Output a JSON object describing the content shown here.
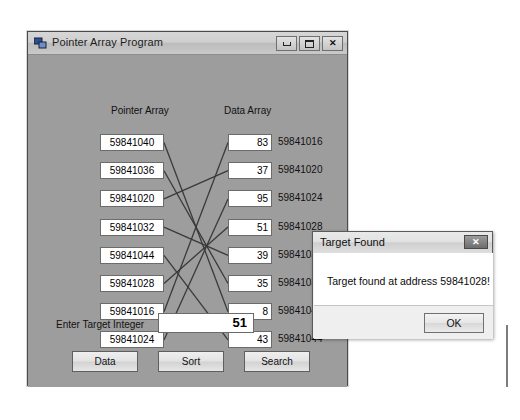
{
  "app_window": {
    "title": "Pointer Array Program",
    "icon": "form-app-icon",
    "controls": {
      "minimize": "minimize-icon",
      "maximize": "maximize-icon",
      "close": "close-icon"
    },
    "headers": {
      "pointer": "Pointer Array",
      "data": "Data Array"
    },
    "pointer_array": [
      "59841040",
      "59841036",
      "59841020",
      "59841032",
      "59841044",
      "59841028",
      "59841016",
      "59841024"
    ],
    "data_array": [
      {
        "value": "83",
        "address": "59841016"
      },
      {
        "value": "37",
        "address": "59841020"
      },
      {
        "value": "95",
        "address": "59841024"
      },
      {
        "value": "51",
        "address": "59841028"
      },
      {
        "value": "39",
        "address": "59841032"
      },
      {
        "value": "35",
        "address": "59841036"
      },
      {
        "value": "8",
        "address": "59841040"
      },
      {
        "value": "43",
        "address": "59841044"
      }
    ],
    "target": {
      "label": "Enter Target Integer",
      "value": "51",
      "placeholder": ""
    },
    "buttons": {
      "data": "Data",
      "sort": "Sort",
      "search": "Search"
    }
  },
  "dialog": {
    "title": "Target Found",
    "message": "Target found at address 59841028!",
    "ok_label": "OK",
    "close_glyph": "✕"
  },
  "colors": {
    "form_background": "#9d9d9d",
    "titlebar": "#cfcfcf",
    "field_background": "#ffffff",
    "wire": "#3a3a3a",
    "dialog_background": "#efefef"
  }
}
